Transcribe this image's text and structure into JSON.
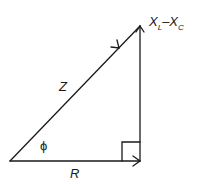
{
  "diagram": {
    "labels": {
      "hypotenuse": "Z",
      "base": "R",
      "angle": "ϕ",
      "vertical_main_1": "X",
      "vertical_sub_1": "L",
      "vertical_minus": "–",
      "vertical_main_2": "X",
      "vertical_sub_2": "C"
    },
    "colors": {
      "stroke": "#1a1a1a",
      "background": "#ffffff"
    }
  }
}
